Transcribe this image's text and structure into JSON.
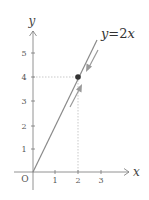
{
  "diagram": {
    "type": "coordinate-plane",
    "axes": {
      "x_label": "x",
      "y_label": "y",
      "origin_label": "O",
      "x_ticks": [
        "1",
        "2",
        "3"
      ],
      "y_ticks": [
        "1",
        "2",
        "3",
        "4",
        "5"
      ]
    },
    "line": {
      "equation_var": "y",
      "equation_eq": "=2",
      "equation_x": "x",
      "equation": "y=2x",
      "color": "#8a8a8a"
    },
    "point": {
      "x": 2,
      "y": 4,
      "color": "#333333"
    },
    "arrows": [
      {
        "direction": "down-left",
        "description": "approaching point from above along line"
      },
      {
        "direction": "up-right",
        "description": "approaching point from below along line"
      }
    ],
    "guide_color": "#c0c0c0"
  }
}
